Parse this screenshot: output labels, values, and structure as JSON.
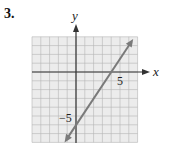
{
  "problem": {
    "number": "3."
  },
  "chart_data": {
    "type": "line",
    "title": "",
    "xlabel": "x",
    "ylabel": "y",
    "xlim": [
      -5,
      7
    ],
    "ylim": [
      -8,
      4
    ],
    "grid": true,
    "tick_labels": {
      "x": [
        "5"
      ],
      "y": [
        "-5"
      ]
    },
    "series": [
      {
        "name": "line",
        "x": [
          -1.3,
          6.5
        ],
        "y": [
          -8,
          3.75
        ],
        "equation": "y = 1.5x - 6",
        "x_intercept": 4,
        "y_intercept": -6,
        "arrows": "both"
      }
    ]
  },
  "labels": {
    "x_axis": "x",
    "y_axis": "y",
    "tick_x5": "5",
    "tick_yneg5": "−5"
  },
  "colors": {
    "grid_fill": "#ececec",
    "grid_line": "#b5b5b5",
    "axis": "#333333",
    "line": "#7a7a7a"
  }
}
